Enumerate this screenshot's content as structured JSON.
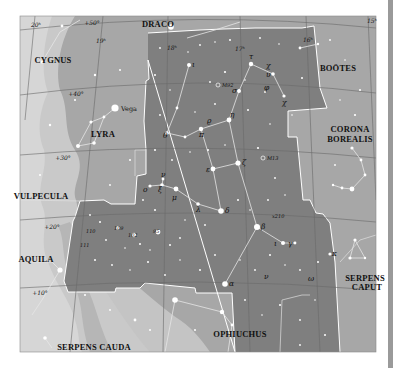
{
  "map": {
    "title": "Hercules star chart",
    "colors": {
      "background": "#a7a7a7",
      "milky_way": "#c9c9c9",
      "milky_way_bright": "#d8d8d8",
      "target": "#7f7f7f",
      "boundary": "#ffffff",
      "grid": "#6e6e6e",
      "figure_line": "#e8e8e8",
      "star": "#ffffff"
    },
    "constellations": [
      {
        "name": "DRACO",
        "x": 158,
        "y": 27
      },
      {
        "name": "CYGNUS",
        "x": 53,
        "y": 63
      },
      {
        "name": "BOÖTES",
        "x": 338,
        "y": 71
      },
      {
        "name": "LYRA",
        "x": 103,
        "y": 137
      },
      {
        "name": "CORONA",
        "x": 350,
        "y": 132
      },
      {
        "name": "BOREALIS",
        "x": 350,
        "y": 142
      },
      {
        "name": "VULPECULA",
        "x": 41,
        "y": 199
      },
      {
        "name": "AQUILA",
        "x": 36,
        "y": 262
      },
      {
        "name": "SERPENS",
        "x": 367,
        "y": 281
      },
      {
        "name": "CAPUT",
        "x": 368,
        "y": 290
      },
      {
        "name": "OPHIUCHUS",
        "x": 240,
        "y": 337
      },
      {
        "name": "SERPENS CAUDA",
        "x": 94,
        "y": 350
      }
    ],
    "grid_labels": [
      {
        "text": "20ʰ",
        "x": 36,
        "y": 27
      },
      {
        "text": "+50°",
        "x": 92,
        "y": 25
      },
      {
        "text": "19ʰ",
        "x": 101,
        "y": 43
      },
      {
        "text": "18ʰ",
        "x": 172,
        "y": 50
      },
      {
        "text": "17ʰ",
        "x": 240,
        "y": 51
      },
      {
        "text": "16ʰ",
        "x": 308,
        "y": 42
      },
      {
        "text": "15ʰ",
        "x": 373,
        "y": 23
      },
      {
        "text": "+40°",
        "x": 76,
        "y": 96
      },
      {
        "text": "+30°",
        "x": 63,
        "y": 160
      },
      {
        "text": "+20°",
        "x": 52,
        "y": 229
      },
      {
        "text": "+10°",
        "x": 40,
        "y": 295
      }
    ],
    "star_labels": [
      {
        "text": "Vega",
        "x": 121,
        "y": 116,
        "style": "name"
      },
      {
        "text": "ι",
        "x": 191,
        "y": 66
      },
      {
        "text": "τ",
        "x": 283,
        "y": 52
      },
      {
        "text": "χ",
        "x": 298,
        "y": 67
      },
      {
        "text": "υ",
        "x": 298,
        "y": 78
      },
      {
        "text": "φ",
        "x": 290,
        "y": 89
      },
      {
        "text": "χ",
        "x": 318,
        "y": 104
      },
      {
        "text": "σ",
        "x": 263,
        "y": 107
      },
      {
        "text": "η",
        "x": 257,
        "y": 139
      },
      {
        "text": "θ",
        "x": 166,
        "y": 132
      },
      {
        "text": "ϱ",
        "x": 209,
        "y": 123
      },
      {
        "text": "π",
        "x": 217,
        "y": 134
      },
      {
        "text": "M92",
        "x": 221,
        "y": 85,
        "style": "num"
      },
      {
        "text": "M13",
        "x": 266,
        "y": 159,
        "style": "num"
      },
      {
        "text": "ζ",
        "x": 274,
        "y": 164
      },
      {
        "text": "ε",
        "x": 228,
        "y": 170
      },
      {
        "text": "ν",
        "x": 159,
        "y": 173
      },
      {
        "text": "ξ",
        "x": 162,
        "y": 188
      },
      {
        "text": "o",
        "x": 143,
        "y": 186
      },
      {
        "text": "μ",
        "x": 173,
        "y": 201
      },
      {
        "text": "λ",
        "x": 196,
        "y": 209
      },
      {
        "text": "δ",
        "x": 226,
        "y": 212
      },
      {
        "text": "x210",
        "x": 271,
        "y": 216,
        "style": "num"
      },
      {
        "text": "β",
        "x": 296,
        "y": 229
      },
      {
        "text": "ι",
        "x": 296,
        "y": 246
      },
      {
        "text": "γ",
        "x": 311,
        "y": 243
      },
      {
        "text": "κ",
        "x": 333,
        "y": 254
      },
      {
        "text": "α",
        "x": 231,
        "y": 286
      },
      {
        "text": "ν",
        "x": 264,
        "y": 277
      },
      {
        "text": "ω",
        "x": 310,
        "y": 281
      },
      {
        "text": "110",
        "x": 86,
        "y": 233,
        "style": "num"
      },
      {
        "text": "109",
        "x": 114,
        "y": 230,
        "style": "num"
      },
      {
        "text": "102",
        "x": 128,
        "y": 237,
        "style": "num"
      },
      {
        "text": "95",
        "x": 153,
        "y": 233,
        "style": "num"
      },
      {
        "text": "111",
        "x": 80,
        "y": 247,
        "style": "num"
      }
    ]
  }
}
